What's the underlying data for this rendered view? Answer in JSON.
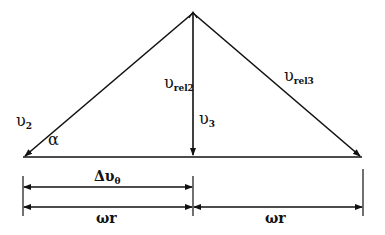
{
  "diagram": {
    "type": "velocity-triangle",
    "labels": {
      "v2": {
        "symbol": "υ",
        "sub": "2"
      },
      "alpha": {
        "symbol": "α"
      },
      "v_rel2": {
        "symbol": "υ",
        "sub": "rel2"
      },
      "v3": {
        "symbol": "υ",
        "sub": "3"
      },
      "v_rel3": {
        "symbol": "υ",
        "sub": "rel3"
      },
      "delta_v_theta": {
        "symbol": "Δυ",
        "sub": "θ"
      },
      "omega_r_left": {
        "symbol": "ωr"
      },
      "omega_r_right": {
        "symbol": "ωr"
      }
    },
    "points": {
      "apex": [
        193,
        13
      ],
      "left_base": [
        23,
        157
      ],
      "right_base": [
        362,
        157
      ],
      "foot": [
        193,
        157
      ]
    },
    "colors": {
      "stroke": "#111111",
      "background": "#ffffff"
    }
  }
}
